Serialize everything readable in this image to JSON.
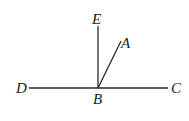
{
  "diagram": {
    "points": {
      "B": {
        "label": "B",
        "x": 98,
        "y": 88
      },
      "E": {
        "label": "E",
        "x": 98,
        "y": 26
      },
      "A": {
        "label": "A",
        "x": 121,
        "y": 41
      },
      "D": {
        "label": "D",
        "x": 29,
        "y": 88
      },
      "C": {
        "label": "C",
        "x": 168,
        "y": 88
      }
    },
    "segments": [
      {
        "name": "line-dc",
        "from": "D",
        "to": "C"
      },
      {
        "name": "ray-be",
        "from": "B",
        "to": "E"
      },
      {
        "name": "ray-ba",
        "from": "B",
        "to": "A"
      }
    ],
    "labels": {
      "E": "E",
      "A": "A",
      "D": "D",
      "B": "B",
      "C": "C"
    },
    "colors": {
      "stroke": "#2a2a2a",
      "text": "#222222",
      "background": "#ffffff"
    }
  }
}
